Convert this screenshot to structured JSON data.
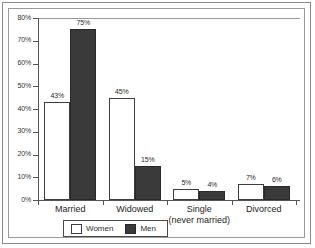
{
  "chart_data": {
    "type": "bar",
    "title": "",
    "xlabel": "",
    "ylabel": "",
    "ylim": [
      0,
      80
    ],
    "ytick_labels": [
      "80%",
      "70%",
      "60%",
      "50%",
      "40%",
      "30%",
      "20%",
      "10%",
      "0%"
    ],
    "yticks": [
      80,
      70,
      60,
      50,
      40,
      30,
      20,
      10,
      0
    ],
    "grid": false,
    "legend_position": "bottom",
    "categories": [
      "Married",
      "Widowed",
      "Single (never married)",
      "Divorced"
    ],
    "category_labels": [
      {
        "line1": "Married",
        "line2": ""
      },
      {
        "line1": "Widowed",
        "line2": ""
      },
      {
        "line1": "Single",
        "line2": "(never married)"
      },
      {
        "line1": "Divorced",
        "line2": ""
      }
    ],
    "series": [
      {
        "name": "Women",
        "color": "#ffffff",
        "values": [
          43,
          45,
          5,
          7
        ],
        "data_labels": [
          "43%",
          "45%",
          "5%",
          "7%"
        ]
      },
      {
        "name": "Men",
        "color": "#3a3a3a",
        "values": [
          75,
          15,
          4,
          6
        ],
        "data_labels": [
          "75%",
          "15%",
          "4%",
          "6%"
        ]
      }
    ]
  },
  "legend": {
    "items": [
      {
        "label": "Women",
        "swatch": "women-swatch"
      },
      {
        "label": "Men",
        "swatch": "men-swatch"
      }
    ]
  }
}
